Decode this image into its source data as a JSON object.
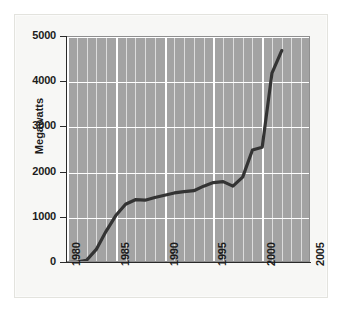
{
  "chart_data": {
    "type": "line",
    "title": "",
    "xlabel": "",
    "ylabel": "Megawatts",
    "xlim": [
      1980,
      2005
    ],
    "ylim": [
      0,
      5000
    ],
    "grid": true,
    "legend": "none",
    "series": [
      {
        "name": "Megawatts",
        "color": "#333333",
        "x": [
          1980,
          1981,
          1982,
          1983,
          1984,
          1985,
          1986,
          1987,
          1988,
          1989,
          1990,
          1991,
          1992,
          1993,
          1994,
          1995,
          1996,
          1997,
          1998,
          1999,
          2000,
          2001,
          2002
        ],
        "values": [
          10,
          20,
          60,
          300,
          700,
          1050,
          1300,
          1400,
          1390,
          1450,
          1500,
          1550,
          1580,
          1600,
          1700,
          1780,
          1800,
          1700,
          1900,
          2500,
          2560,
          4200,
          4700
        ]
      }
    ],
    "y_ticks": [
      0,
      1000,
      2000,
      3000,
      4000,
      5000
    ],
    "y_tick_labels": [
      "0",
      "1000",
      "2000",
      "3000",
      "4000",
      "5000"
    ],
    "x_ticks": [
      1980,
      1985,
      1990,
      1995,
      2000,
      2005
    ],
    "x_tick_labels": [
      "1980",
      "1985",
      "1990",
      "1995",
      "2000",
      "2005"
    ],
    "plot_background": "#a3a3a3",
    "gridline_color": "#ffffff",
    "axis_color": "#2a2a2a"
  }
}
